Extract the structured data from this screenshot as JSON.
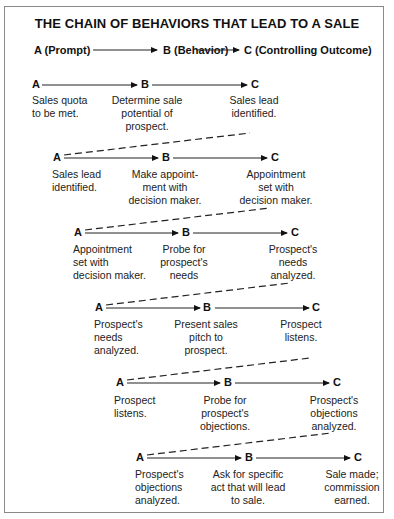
{
  "title": "THE CHAIN OF BEHAVIORS THAT LEAD TO A SALE",
  "legend": {
    "a": "A (Prompt)",
    "b": "B (Behavior)",
    "c": "C (Controlling Outcome)"
  },
  "node_labels": {
    "a": "A",
    "b": "B",
    "c": "C"
  },
  "rows": [
    {
      "a": "Sales quota\nto be met.",
      "b": "Determine sale\npotential of\nprospect.",
      "c": "Sales lead\nidentified."
    },
    {
      "a": "Sales lead\nidentified.",
      "b": "Make appoint-\nment with\ndecision maker.",
      "c": "Appointment\nset with\ndecision maker."
    },
    {
      "a": "Appointment\nset with\ndecision maker.",
      "b": "Probe for\nprospect's\nneeds",
      "c": "Prospect's\nneeds\nanalyzed."
    },
    {
      "a": "Prospect's\nneeds\nanalyzed.",
      "b": "Present sales\npitch to\nprospect.",
      "c": "Prospect\nlistens."
    },
    {
      "a": "Prospect\nlistens.",
      "b": "Probe for\nprospect's\nobjections.",
      "c": "Prospect's\nobjections\nanalyzed."
    },
    {
      "a": "Prospect's\nobjections\nanalyzed.",
      "b": "Ask for specific\nact that will lead\nto sale.",
      "c": "Sale made;\ncommission\nearned."
    }
  ]
}
